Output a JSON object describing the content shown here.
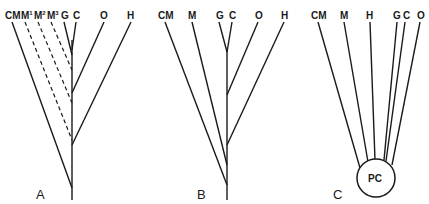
{
  "figure": {
    "panels": [
      {
        "id": "A",
        "label": "A",
        "taxa": [
          "CM",
          "M",
          "M",
          "M",
          "G",
          "C",
          "O",
          "H"
        ],
        "superscripts": [
          "",
          "1",
          "2",
          "3",
          "",
          "",
          "",
          ""
        ],
        "note": "M1, M2, M3 joined with dashed lines"
      },
      {
        "id": "B",
        "label": "B",
        "taxa": [
          "CM",
          "M",
          "G",
          "C",
          "O",
          "H"
        ]
      },
      {
        "id": "C",
        "label": "C",
        "taxa": [
          "CM",
          "M",
          "H",
          "G",
          "C",
          "O"
        ],
        "root_label": "PC"
      }
    ]
  }
}
